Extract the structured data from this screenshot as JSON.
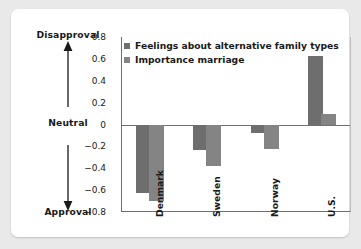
{
  "chart_data": {
    "type": "bar",
    "title": "",
    "xlabel": "",
    "ylabel": "",
    "categories": [
      "Denmark",
      "Sweden",
      "Norway",
      "U.S."
    ],
    "series": [
      {
        "name": "Feelings about alternative family types",
        "color": "#6e6e6e",
        "values": [
          -0.63,
          -0.23,
          -0.08,
          0.63
        ]
      },
      {
        "name": "Importance marriage",
        "color": "#848484",
        "values": [
          -0.7,
          -0.38,
          -0.22,
          0.1
        ]
      }
    ],
    "ylim": [
      -0.8,
      0.8
    ],
    "yticks": [
      "0.8",
      "0.6",
      "0.4",
      "0.2",
      "0",
      "-0.2",
      "-0.4",
      "-0.6",
      "-0.8"
    ],
    "ytick_values": [
      0.8,
      0.6,
      0.4,
      0.2,
      0,
      -0.2,
      -0.4,
      -0.6,
      -0.8
    ],
    "grid": false,
    "zero_line": true,
    "legend_position": "top-left-inside"
  },
  "legend": {
    "items": [
      {
        "label": "Feelings about alternative family types",
        "color": "#6e6e6e"
      },
      {
        "label": "Importance marriage",
        "color": "#848484"
      }
    ]
  },
  "axis_annotation": {
    "top": "Disapproval",
    "middle": "Neutral",
    "bottom": "Approval"
  },
  "colors": {
    "series_a": "#6e6e6e",
    "series_b": "#848484",
    "axis": "#6f6f6f",
    "text": "#1a1a1a",
    "card": "#ffffff",
    "page_background": "#e9e9e9"
  }
}
